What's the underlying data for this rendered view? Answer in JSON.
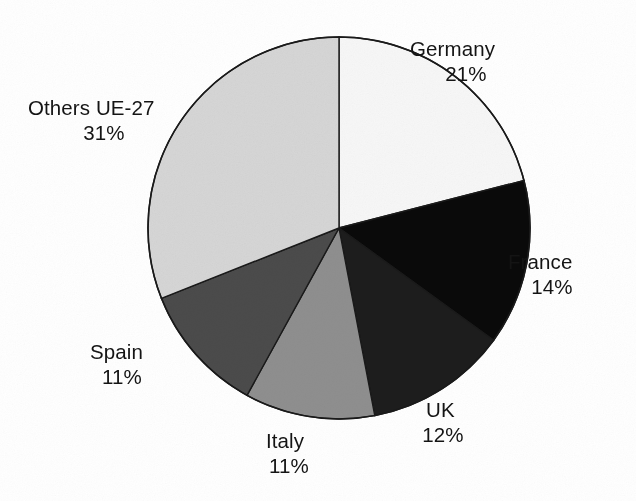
{
  "chart_data": {
    "type": "pie",
    "title": "",
    "subtitle": "",
    "xlabel": "",
    "ylabel": "",
    "legend_position": "none",
    "grid": false,
    "value_suffix": "%",
    "start_angle_deg": 0,
    "direction": "clockwise",
    "categories": [
      "Germany",
      "France",
      "UK",
      "Italy",
      "Spain",
      "Others UE-27"
    ],
    "values": [
      21,
      14,
      12,
      11,
      11,
      31
    ],
    "total": 100,
    "slices": [
      {
        "label": "Germany",
        "value": 21,
        "value_text": "21%",
        "color": "#f7f7f7",
        "label_position": "right-top"
      },
      {
        "label": "France",
        "value": 14,
        "value_text": "14%",
        "color": "#0a0a0a",
        "label_position": "right"
      },
      {
        "label": "UK",
        "value": 12,
        "value_text": "12%",
        "color": "#1d1d1d",
        "label_position": "bottom-right"
      },
      {
        "label": "Italy",
        "value": 11,
        "value_text": "11%",
        "color": "#8f8f8f",
        "label_position": "bottom"
      },
      {
        "label": "Spain",
        "value": 11,
        "value_text": "11%",
        "color": "#4b4b4b",
        "label_position": "bottom-left"
      },
      {
        "label": "Others UE-27",
        "value": 31,
        "value_text": "31%",
        "color": "#d6d6d6",
        "label_position": "left-top"
      }
    ],
    "geometry": {
      "center_x": 339,
      "center_y": 228,
      "radius": 191,
      "outline_color": "#1a1a1a"
    }
  },
  "labels": {
    "germany": {
      "name": "Germany",
      "value": "21%"
    },
    "france": {
      "name": "France",
      "value": "14%"
    },
    "uk": {
      "name": "UK",
      "value": "12%"
    },
    "italy": {
      "name": "Italy",
      "value": "11%"
    },
    "spain": {
      "name": "Spain",
      "value": "11%"
    },
    "others": {
      "name": "Others UE-27",
      "value": "31%"
    }
  }
}
